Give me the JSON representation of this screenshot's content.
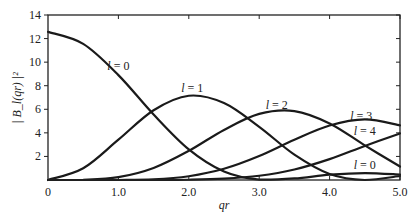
{
  "chart_data": {
    "type": "line",
    "title": "",
    "xlabel": "qr",
    "ylabel": "| B_l(qr) |²",
    "xlim": [
      0,
      5.0
    ],
    "ylim": [
      0,
      14
    ],
    "grid": false,
    "legend": "inline curve labels",
    "x_ticks": [
      "0",
      "1.0",
      "2.0",
      "3.0",
      "4.0",
      "5.0"
    ],
    "y_ticks": [
      "2",
      "4",
      "6",
      "8",
      "10",
      "12",
      "14"
    ],
    "x": [
      0,
      0.5,
      1.0,
      1.5,
      2.0,
      2.5,
      3.0,
      3.5,
      4.0,
      4.5,
      5.0
    ],
    "series": [
      {
        "name": "l = 0",
        "values": [
          12.57,
          11.55,
          8.9,
          5.56,
          2.6,
          0.72,
          0.03,
          0.13,
          0.45,
          0.59,
          0.46
        ]
      },
      {
        "name": "l = 1",
        "values": [
          0.0,
          0.995,
          3.42,
          5.92,
          7.15,
          6.53,
          4.51,
          2.15,
          0.51,
          0.0,
          0.34
        ]
      },
      {
        "name": "l = 2",
        "values": [
          0.0,
          0.017,
          0.24,
          1.02,
          2.47,
          4.25,
          5.61,
          5.85,
          4.8,
          2.94,
          1.14
        ]
      },
      {
        "name": "l = 3",
        "values": [
          0.0,
          0.0,
          0.0,
          0.05,
          0.32,
          0.95,
          2.03,
          3.41,
          4.62,
          5.14,
          4.64
        ]
      },
      {
        "name": "l = 4",
        "values": [
          0.0,
          0.0,
          0.0,
          0.0,
          0.02,
          0.11,
          0.36,
          0.89,
          1.77,
          2.89,
          3.95
        ]
      }
    ],
    "annotations": [
      {
        "text": "l = 0",
        "x": 1.0,
        "y": 9.3
      },
      {
        "text": "l = 1",
        "x": 2.05,
        "y": 7.5
      },
      {
        "text": "l = 2",
        "x": 3.25,
        "y": 6.0
      },
      {
        "text": "l = 3",
        "x": 4.45,
        "y": 5.1
      },
      {
        "text": "l = 4",
        "x": 4.5,
        "y": 3.8
      },
      {
        "text": "l = 0",
        "x": 4.5,
        "y": 0.9
      }
    ]
  }
}
